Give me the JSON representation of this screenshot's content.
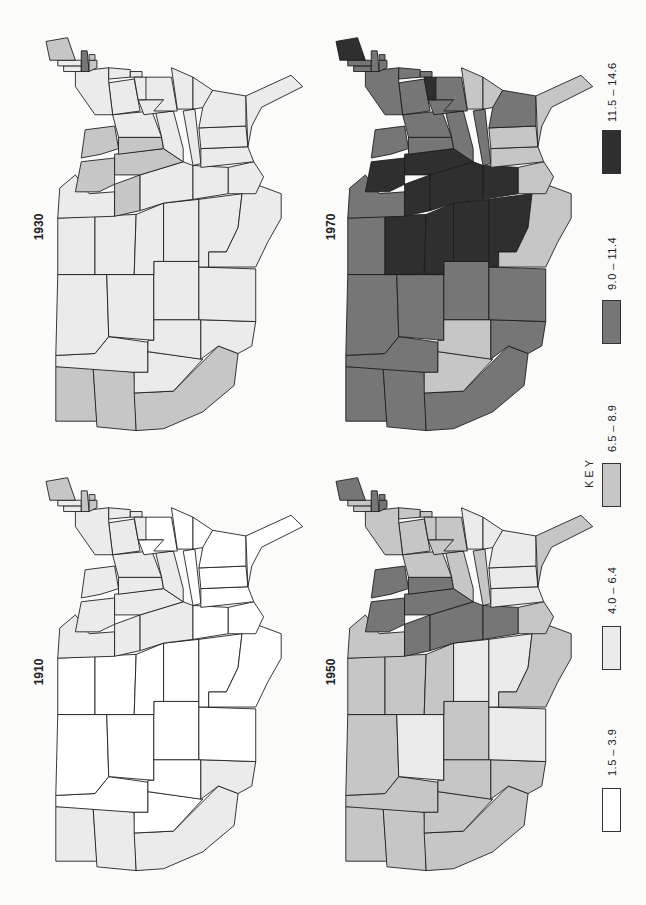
{
  "chart_data": {
    "type": "choropleth",
    "title": "",
    "orientation": "page rotated 90deg counter-clockwise (labels read bottom-to-top)",
    "legend": {
      "title": "KEY",
      "classes": [
        {
          "label": "1.5 – 3.9",
          "color": "#ffffff"
        },
        {
          "label": "4.0 – 6.4",
          "color": "#ebebeb"
        },
        {
          "label": "6.5 – 8.9",
          "color": "#c6c6c6"
        },
        {
          "label": "9.0 – 11.4",
          "color": "#767676"
        },
        {
          "label": "11.5 – 14.6",
          "color": "#2f2f2f"
        }
      ]
    },
    "panels": [
      {
        "year": "1930",
        "position": "top-left"
      },
      {
        "year": "1970",
        "position": "top-right"
      },
      {
        "year": "1910",
        "position": "bottom-left"
      },
      {
        "year": "1950",
        "position": "bottom-right"
      }
    ],
    "states_order": [
      "WA",
      "OR",
      "CA",
      "ID",
      "NV",
      "MT",
      "WY",
      "UT",
      "AZ",
      "CO",
      "NM",
      "ND",
      "SD",
      "NE",
      "KS",
      "OK",
      "TX",
      "MN",
      "IA",
      "MO",
      "AR",
      "LA",
      "WI",
      "IL",
      "MI",
      "IN",
      "KY",
      "TN",
      "MS",
      "AL",
      "OH",
      "WV",
      "VA",
      "NC",
      "SC",
      "GA",
      "FL",
      "PA",
      "NY",
      "VT",
      "NH",
      "ME",
      "MA",
      "CT",
      "RI",
      "NJ",
      "DE",
      "MD"
    ],
    "classes_by_year": {
      "1910": [
        1,
        1,
        1,
        0,
        0,
        0,
        0,
        0,
        1,
        0,
        0,
        0,
        0,
        0,
        0,
        0,
        0,
        1,
        1,
        1,
        0,
        0,
        1,
        1,
        1,
        1,
        1,
        0,
        0,
        0,
        1,
        0,
        0,
        0,
        0,
        0,
        0,
        1,
        1,
        1,
        1,
        2,
        2,
        2,
        2,
        1,
        1,
        1
      ],
      "1930": [
        2,
        2,
        2,
        1,
        1,
        1,
        1,
        1,
        1,
        1,
        1,
        1,
        1,
        1,
        1,
        1,
        1,
        1,
        2,
        1,
        1,
        1,
        2,
        2,
        2,
        2,
        1,
        1,
        1,
        1,
        1,
        1,
        1,
        1,
        1,
        1,
        1,
        1,
        1,
        1,
        1,
        2,
        3,
        2,
        2,
        1,
        1,
        1
      ],
      "1950": [
        2,
        2,
        2,
        2,
        2,
        2,
        1,
        2,
        2,
        2,
        1,
        2,
        2,
        2,
        1,
        1,
        2,
        2,
        3,
        3,
        3,
        2,
        3,
        3,
        3,
        3,
        2,
        2,
        1,
        1,
        2,
        2,
        2,
        1,
        1,
        1,
        2,
        2,
        2,
        2,
        2,
        3,
        3,
        3,
        3,
        2,
        2,
        2
      ],
      "1970": [
        3,
        3,
        3,
        3,
        2,
        3,
        3,
        2,
        3,
        3,
        3,
        3,
        4,
        4,
        4,
        4,
        2,
        3,
        4,
        4,
        4,
        2,
        4,
        4,
        3,
        3,
        3,
        3,
        2,
        2,
        3,
        3,
        3,
        2,
        2,
        3,
        2,
        3,
        3,
        3,
        3,
        4,
        3,
        3,
        3,
        3,
        3,
        4
      ]
    }
  }
}
